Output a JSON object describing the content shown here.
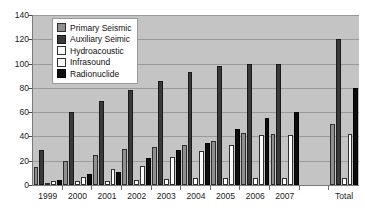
{
  "chart_data": {
    "type": "bar",
    "title": "",
    "xlabel": "",
    "ylabel": "",
    "ylim": [
      0,
      140
    ],
    "ytick_step": 20,
    "yticks": [
      140,
      120,
      100,
      80,
      60,
      40,
      20,
      0
    ],
    "grid": true,
    "legend_position": "top-left-inside",
    "categories": [
      "1999",
      "2000",
      "2001",
      "2002",
      "2003",
      "2004",
      "2005",
      "2006",
      "2007",
      "",
      "Total"
    ],
    "series": [
      {
        "name": "Primary Seismic",
        "color": "#8f8f8f",
        "values": [
          15,
          20,
          25,
          30,
          31,
          33,
          36,
          43,
          42,
          null,
          50
        ]
      },
      {
        "name": "Auxiliary Seimic",
        "color": "#3a3a3a",
        "values": [
          29,
          60,
          69,
          78,
          86,
          93,
          98,
          100,
          100,
          null,
          120
        ]
      },
      {
        "name": "Hydroacoustic",
        "color": "#ffffff",
        "values": [
          1,
          3,
          3,
          4,
          5,
          6,
          6,
          6,
          6,
          null,
          6
        ]
      },
      {
        "name": "Infrasound",
        "color": "#fbfbfb",
        "values": [
          3,
          7,
          13,
          16,
          23,
          28,
          33,
          41,
          41,
          null,
          42
        ]
      },
      {
        "name": "Radionuclide",
        "color": "#0d0d0d",
        "values": [
          4,
          9,
          11,
          22,
          29,
          35,
          46,
          55,
          60,
          null,
          80
        ]
      }
    ],
    "legend_entries": [
      "Primary Seismic",
      "Auxiliary Seimic",
      "Hydroacoustic",
      "Infrasound",
      "Radionuclide"
    ]
  }
}
